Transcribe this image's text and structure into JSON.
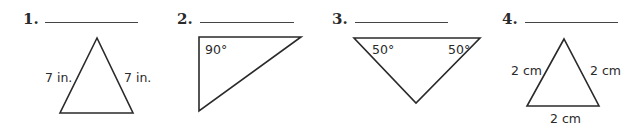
{
  "problems": [
    {
      "number": "1.",
      "labels": {
        "left_side": "7 in.",
        "right_side": "7 in."
      }
    },
    {
      "number": "2.",
      "labels": {
        "angle": "90°"
      }
    },
    {
      "number": "3.",
      "labels": {
        "left_angle": "50°",
        "right_angle": "50°"
      }
    },
    {
      "number": "4.",
      "labels": {
        "left_side": "2 cm",
        "right_side": "2 cm",
        "base": "2 cm"
      }
    }
  ]
}
